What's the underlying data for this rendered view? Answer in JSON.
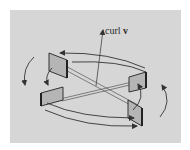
{
  "diagram": {
    "axis_label": {
      "text": "curl",
      "vector": "v"
    },
    "elements": [
      {
        "name": "curl-axis-arrow",
        "description": "vertical arrow pointing up, labeled curl v"
      },
      {
        "name": "paddle-back-left",
        "description": "square paddle at rear left"
      },
      {
        "name": "paddle-back-right",
        "description": "square paddle at rear right"
      },
      {
        "name": "paddle-front-left",
        "description": "square paddle at front left"
      },
      {
        "name": "paddle-front-right",
        "description": "square paddle at front right"
      },
      {
        "name": "rotation-arrows",
        "description": "curved arrows indicating counterclockwise circulation around the axis"
      }
    ],
    "colors": {
      "background": "#ffffff",
      "panel": "#d6d6d6",
      "paddle_fill": "#b5b5b5",
      "stroke": "#333333"
    }
  }
}
